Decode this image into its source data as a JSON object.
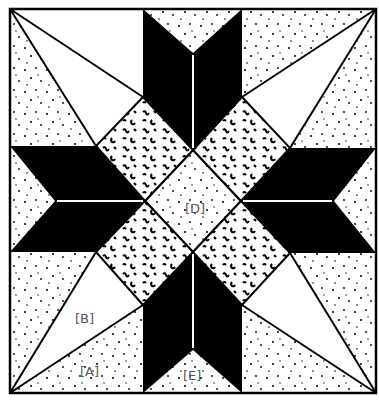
{
  "diagram": {
    "type": "quilt-block",
    "pattern": "eight-pointed star",
    "colors": {
      "background": "#ffffff",
      "dark_fabric": "#000000",
      "outline": "#000000",
      "label_text": "#555555"
    },
    "labels": {
      "A": "[A]",
      "B": "[B]",
      "D": "[D]",
      "E": "[E]"
    },
    "pieces": [
      {
        "id": "A",
        "shape": "triangle",
        "fill": "speckled",
        "location": "bottom-left lower corner triangle"
      },
      {
        "id": "B",
        "shape": "kite",
        "fill": "plain",
        "location": "bottom-left kite"
      },
      {
        "id": "D",
        "shape": "diamond",
        "fill": "speckled",
        "location": "center"
      },
      {
        "id": "E",
        "shape": "triangle",
        "fill": "speckled",
        "location": "bottom edge setting triangle"
      }
    ]
  }
}
